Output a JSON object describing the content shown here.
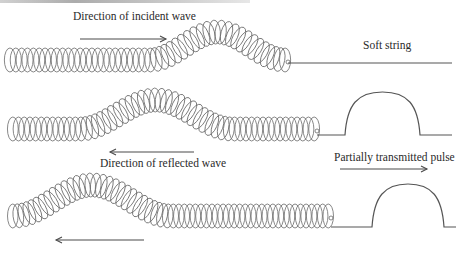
{
  "title": {
    "text": "",
    "note": "cut off at top edge"
  },
  "colors": {
    "spring": "#6a6a6a",
    "string": "#555555",
    "arrow": "#4a4a4a",
    "text": "#2a2a2a"
  },
  "panels": [
    {
      "id": "incident",
      "spring": {
        "x0": 7,
        "x1": 288,
        "baseline": 60,
        "half_height": 12,
        "coils": 48,
        "bump_start": 150,
        "bump_end": 285,
        "bump_height": -28
      },
      "string": {
        "x0": 288,
        "x1": 452,
        "y": 63,
        "pulse": null
      },
      "labels": [
        {
          "key": "incident_label",
          "text": "Direction of incident wave",
          "x": 72,
          "y": 10
        },
        {
          "key": "soft_string_label",
          "text": "Soft string",
          "x": 362,
          "y": 40
        }
      ],
      "arrows": [
        {
          "x0": 80,
          "x1": 166,
          "y": 39,
          "direction": "right"
        }
      ]
    },
    {
      "id": "reflected",
      "spring": {
        "x0": 10,
        "x1": 317,
        "baseline": 129,
        "half_height": 12,
        "coils": 54,
        "bump_start": 80,
        "bump_end": 232,
        "bump_height": -29
      },
      "string": {
        "x0": 317,
        "x1": 452,
        "y": 135,
        "pulse": {
          "x0": 345,
          "x1": 420,
          "top": 92
        }
      },
      "labels": [
        {
          "key": "reflected_label",
          "text": "Direction of reflected wave",
          "x": 99,
          "y": 158
        },
        {
          "key": "transmitted_label",
          "text": "Partially transmitted pulse",
          "x": 333,
          "y": 152
        }
      ],
      "arrows": [
        {
          "x0": 194,
          "x1": 110,
          "y": 152,
          "direction": "left"
        },
        {
          "x0": 340,
          "x1": 427,
          "y": 169,
          "direction": "right"
        }
      ]
    },
    {
      "id": "after",
      "spring": {
        "x0": 10,
        "x1": 331,
        "baseline": 216,
        "half_height": 12,
        "coils": 58,
        "bump_start": 14,
        "bump_end": 170,
        "bump_height": -31
      },
      "string": {
        "x0": 331,
        "x1": 456,
        "y": 227,
        "pulse": {
          "x0": 372,
          "x1": 444,
          "top": 184
        }
      },
      "labels": [],
      "arrows": [
        {
          "x0": 144,
          "x1": 56,
          "y": 240,
          "direction": "left"
        }
      ]
    }
  ],
  "text": {
    "incident_label": "Direction of incident wave",
    "soft_string_label": "Soft string",
    "reflected_label": "Direction of reflected wave",
    "transmitted_label": "Partially transmitted pulse"
  },
  "icons": {
    "arrow_right": "arrow-right",
    "arrow_left": "arrow-left"
  }
}
